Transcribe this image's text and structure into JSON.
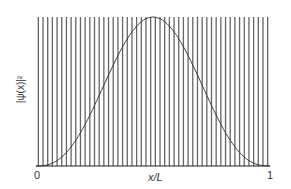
{
  "figure": {
    "ylabel": "|ψ(x)|²",
    "xlabel": "x/L",
    "x_tick_start": "0",
    "x_tick_end": "1"
  },
  "chart_data": {
    "type": "line",
    "title": "",
    "xlabel": "x/L",
    "ylabel": "|ψ(x)|²",
    "xlim": [
      0,
      1
    ],
    "x_ticks": [
      "0",
      "1"
    ],
    "series": [
      {
        "name": "rapid oscillation (vertical lines)",
        "description": "densely packed vertical lines spanning full height",
        "count": 50
      },
      {
        "name": "envelope",
        "description": "bell-shaped smooth curve peaking at x/L = 0.5, zero at 0 and 1",
        "x": [
          0,
          0.1,
          0.2,
          0.3,
          0.4,
          0.5,
          0.6,
          0.7,
          0.8,
          0.9,
          1.0
        ],
        "y": [
          0,
          0.1,
          0.35,
          0.65,
          0.9,
          1.0,
          0.9,
          0.65,
          0.35,
          0.1,
          0
        ]
      }
    ],
    "colors": {
      "lines": "#555555",
      "envelope": "#333333",
      "axis": "#222222"
    }
  }
}
